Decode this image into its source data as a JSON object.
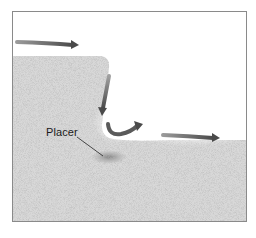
{
  "diagram": {
    "title": "",
    "labels": {
      "placer": "Placer"
    },
    "elements": [
      {
        "type": "terrain",
        "name": "upland-plateau",
        "description": "high ground on left with rounded edge"
      },
      {
        "type": "terrain",
        "name": "valley-floor",
        "description": "lower ground on right"
      },
      {
        "type": "arrow",
        "name": "flow-arrow-top",
        "direction": "right"
      },
      {
        "type": "arrow",
        "name": "flow-arrow-down-cliff",
        "direction": "down"
      },
      {
        "type": "arrow",
        "name": "flow-arrow-eddy",
        "direction": "curved-up-right"
      },
      {
        "type": "arrow",
        "name": "flow-arrow-downstream",
        "direction": "right"
      },
      {
        "type": "deposit",
        "name": "placer-deposit",
        "label_ref": "placer"
      }
    ],
    "colors": {
      "terrain": "#d9d9d9",
      "arrow": "#555555",
      "frame": "#8a8a8a",
      "deposit": "#8c8c8c"
    }
  }
}
